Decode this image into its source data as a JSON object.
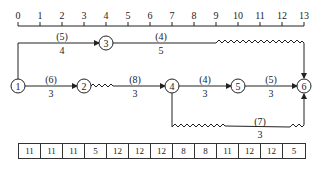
{
  "timescale": {
    "ticks": [
      "0",
      "1",
      "2",
      "3",
      "4",
      "5",
      "6",
      "7",
      "8",
      "9",
      "10",
      "11",
      "12",
      "13"
    ]
  },
  "nodes": [
    {
      "id": "1",
      "label": "1"
    },
    {
      "id": "2",
      "label": "2"
    },
    {
      "id": "3",
      "label": "3"
    },
    {
      "id": "4",
      "label": "4"
    },
    {
      "id": "5",
      "label": "5"
    },
    {
      "id": "6",
      "label": "6"
    }
  ],
  "activities": [
    {
      "from": "1",
      "to": "3",
      "resource": "(5)",
      "duration": "4"
    },
    {
      "from": "3",
      "to": "6",
      "resource": "(4)",
      "duration": "5"
    },
    {
      "from": "1",
      "to": "2",
      "resource": "(6)",
      "duration": "3"
    },
    {
      "from": "2",
      "to": "4",
      "resource": "(8)",
      "duration": "3"
    },
    {
      "from": "4",
      "to": "5",
      "resource": "(4)",
      "duration": "3"
    },
    {
      "from": "5",
      "to": "6",
      "resource": "(5)",
      "duration": "3"
    },
    {
      "from": "4",
      "to": "6",
      "resource": "(7)",
      "duration": "3"
    }
  ],
  "resource_table": [
    "11",
    "11",
    "11",
    "5",
    "12",
    "12",
    "12",
    "8",
    "8",
    "11",
    "12",
    "12",
    "5"
  ]
}
